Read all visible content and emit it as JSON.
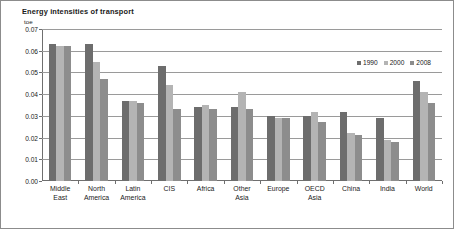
{
  "figure": {
    "title": "Energy intensities of transport",
    "unit_label": "toe"
  },
  "legend": {
    "position": "top-right",
    "items": [
      {
        "label": "1990",
        "color": "#6d6d6d"
      },
      {
        "label": "2000",
        "color": "#b4b4b4"
      },
      {
        "label": "2008",
        "color": "#8d8d8d"
      }
    ]
  },
  "axis": {
    "y_ticks": [
      "0.00",
      "0.01",
      "0.02",
      "0.03",
      "0.04",
      "0.05",
      "0.06",
      "0.07"
    ]
  },
  "chart_data": {
    "type": "bar",
    "title": "Energy intensities of transport",
    "xlabel": "",
    "ylabel": "toe",
    "ylim": [
      0,
      0.07
    ],
    "ytick_step": 0.01,
    "grid": true,
    "legend_position": "top-right",
    "categories": [
      "Middle\nEast",
      "North\nAmerica",
      "Latin\nAmerica",
      "CIS",
      "Africa",
      "Other\nAsia",
      "Europe",
      "OECD\nAsia",
      "China",
      "India",
      "World"
    ],
    "series": [
      {
        "name": "1990",
        "color": "#6d6d6d",
        "values": [
          0.063,
          0.063,
          0.037,
          0.053,
          0.034,
          0.034,
          0.03,
          0.03,
          0.032,
          0.029,
          0.046
        ]
      },
      {
        "name": "2000",
        "color": "#b4b4b4",
        "values": [
          0.062,
          0.055,
          0.037,
          0.044,
          0.035,
          0.041,
          0.029,
          0.032,
          0.022,
          0.019,
          0.041
        ]
      },
      {
        "name": "2008",
        "color": "#8d8d8d",
        "values": [
          0.062,
          0.047,
          0.036,
          0.033,
          0.033,
          0.033,
          0.029,
          0.027,
          0.021,
          0.018,
          0.036
        ]
      }
    ]
  }
}
